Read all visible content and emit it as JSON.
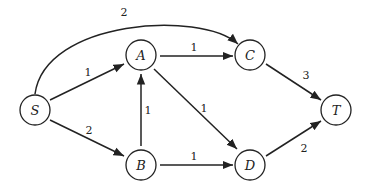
{
  "graph": {
    "nodes": [
      {
        "id": "S",
        "label": "S",
        "x": 35,
        "y": 110
      },
      {
        "id": "A",
        "label": "A",
        "x": 141,
        "y": 55
      },
      {
        "id": "B",
        "label": "B",
        "x": 141,
        "y": 165
      },
      {
        "id": "C",
        "label": "C",
        "x": 250,
        "y": 55
      },
      {
        "id": "D",
        "label": "D",
        "x": 250,
        "y": 165
      },
      {
        "id": "T",
        "label": "T",
        "x": 336,
        "y": 110
      }
    ],
    "edges": [
      {
        "from": "S",
        "to": "A",
        "weight": "1"
      },
      {
        "from": "S",
        "to": "B",
        "weight": "2"
      },
      {
        "from": "S",
        "to": "C",
        "weight": "2"
      },
      {
        "from": "A",
        "to": "C",
        "weight": "1"
      },
      {
        "from": "A",
        "to": "D",
        "weight": "1"
      },
      {
        "from": "B",
        "to": "A",
        "weight": "1"
      },
      {
        "from": "B",
        "to": "D",
        "weight": "1"
      },
      {
        "from": "C",
        "to": "T",
        "weight": "3"
      },
      {
        "from": "D",
        "to": "T",
        "weight": "2"
      }
    ]
  },
  "colors": {
    "stroke": "#222222",
    "background": "#ffffff"
  }
}
